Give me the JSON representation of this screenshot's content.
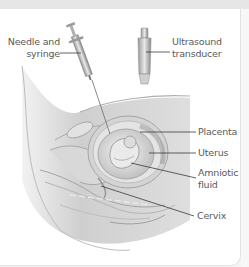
{
  "diagram": {
    "labels": {
      "needle": "Needle and syringe",
      "needle_line1": "Needle and",
      "needle_line2": "syringe",
      "ultrasound_line1": "Ultrasound",
      "ultrasound_line2": "transducer",
      "placenta": "Placenta",
      "uterus": "Uterus",
      "amniotic_line1": "Amniotic",
      "amniotic_line2": "fluid",
      "cervix": "Cervix"
    },
    "colors": {
      "background": "#ffffff",
      "label_text": "#5a5a5a",
      "leader_line": "#3a3a3a",
      "illustration_gray": "#c8c8c8",
      "top_band": "#e6e6e6"
    }
  }
}
